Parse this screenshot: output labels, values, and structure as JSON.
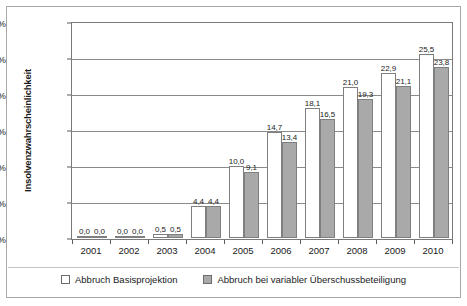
{
  "chart_data": {
    "type": "bar",
    "title": "",
    "xlabel": "",
    "ylabel": "Insolvenzwahrscheinlichkeit",
    "ylim": [
      0,
      30
    ],
    "ytick_labels": [
      "0 %",
      "5 %",
      "10 %",
      "15 %",
      "20 %",
      "25 %",
      "30 %"
    ],
    "ytick_values": [
      0,
      5,
      10,
      15,
      20,
      25,
      30
    ],
    "grid": true,
    "legend_position": "bottom",
    "categories": [
      "2001",
      "2002",
      "2003",
      "2004",
      "2005",
      "2006",
      "2007",
      "2008",
      "2009",
      "2010"
    ],
    "series": [
      {
        "name": "Abbruch Basisprojektion",
        "color": "#ffffff",
        "values": [
          0.0,
          0.0,
          0.5,
          4.4,
          10.0,
          14.7,
          18.1,
          21.0,
          22.9,
          25.5
        ],
        "labels": [
          "0,0",
          "0,0",
          "0,5",
          "4,4",
          "10,0",
          "14,7",
          "18,1",
          "21,0",
          "22,9",
          "25,5"
        ]
      },
      {
        "name": "Abbruch bei variabler Überschussbeteiligung",
        "color": "#a9a9a9",
        "values": [
          0.0,
          0.0,
          0.5,
          4.4,
          9.1,
          13.4,
          16.5,
          19.3,
          21.1,
          23.8
        ],
        "labels": [
          "0,0",
          "0,0",
          "0,5",
          "4,4",
          "9,1",
          "13,4",
          "16,5",
          "19,3",
          "21,1",
          "23,8"
        ]
      }
    ]
  },
  "legend": {
    "items": [
      {
        "label": "Abbruch Basisprojektion",
        "swatch": "base"
      },
      {
        "label": "Abbruch bei variabler Überschussbeteiligung",
        "swatch": "var"
      }
    ]
  },
  "colors": {
    "series_base": "#ffffff",
    "series_var": "#a9a9a9",
    "bar_border": "#7f7f7f",
    "grid": "#8a8a8a",
    "frame": "#7a7a7a",
    "outer_frame": "#a8a8a8",
    "text": "#1a1a1a"
  }
}
